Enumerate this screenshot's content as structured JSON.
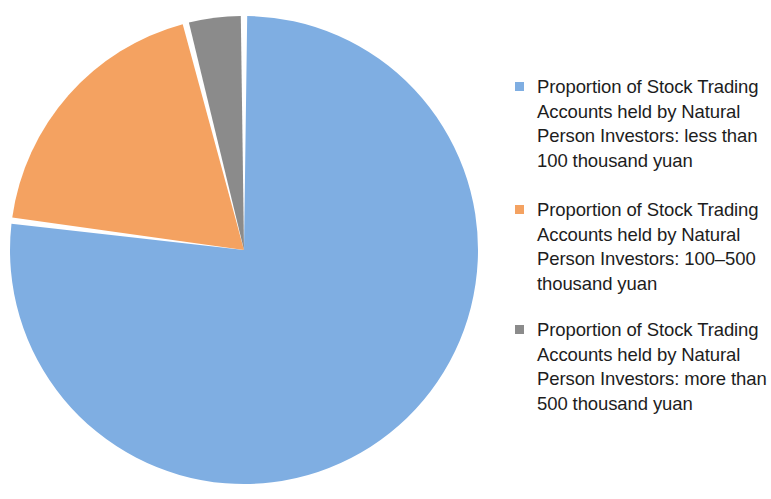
{
  "chart_data": {
    "type": "pie",
    "title": "",
    "subtitle": "",
    "xlabel": "",
    "ylabel": "",
    "grid": false,
    "legend_position": "right",
    "start_angle_deg": 0,
    "direction": "clockwise",
    "categories": [
      "Proportion of Stock Trading Accounts held by Natural Person Investors: less than 100 thousand yuan",
      "Proportion of Stock Trading Accounts held by Natural Person Investors: 100–500 thousand yuan",
      "Proportion of Stock Trading Accounts held by Natural Person Investors: more than 500 thousand yuan"
    ],
    "values": [
      77,
      19,
      4
    ],
    "colors": [
      "#7FAEE2",
      "#F4A261",
      "#8B8B8B"
    ],
    "slice_angles_deg": [
      277.2,
      68.4,
      14.4
    ]
  },
  "legend": {
    "entries": [
      {
        "label": "Proportion of Stock Trading\nAccounts held by Natural\nPerson Investors: less than\n100 thousand yuan",
        "color": "#7FAEE2",
        "marker": "square-marker"
      },
      {
        "label": "Proportion of Stock Trading\nAccounts held by Natural\nPerson Investors: 100–500\nthousand yuan",
        "color": "#F4A261",
        "marker": "square-marker"
      },
      {
        "label": "Proportion of Stock Trading\nAccounts held by Natural\nPerson Investors: more than\n500 thousand yuan",
        "color": "#8B8B8B",
        "marker": "square-marker"
      }
    ]
  },
  "canvas": {
    "background": "#FFFFFF",
    "separator_color": "#FFFFFF"
  }
}
